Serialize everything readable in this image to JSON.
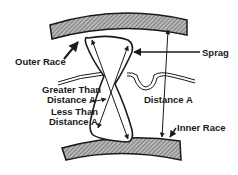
{
  "diagram": {
    "type": "sprag-clutch-cross-section",
    "labels": {
      "outer_race": "Outer Race",
      "sprag": "Sprag",
      "greater_line1": "Greater Than",
      "greater_line2": "Distance A",
      "less_line1": "Less Than",
      "less_line2": "Distance A",
      "distance_a": "Distance A",
      "inner_race": "Inner Race"
    },
    "colors": {
      "ink": "#1a1a1a",
      "hatch_fill": "#9a9a9a",
      "background": "#ffffff"
    }
  }
}
